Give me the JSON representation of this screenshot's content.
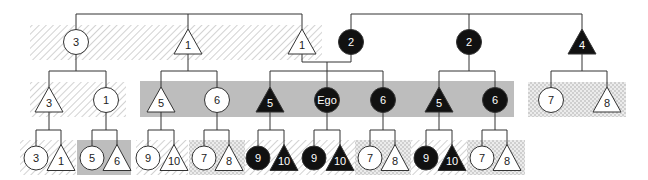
{
  "diagram": {
    "type": "kinship-chart",
    "colors": {
      "line": "#333333",
      "filled": "#111111",
      "open": "#ffffff",
      "band_gray": "#bdbdbd",
      "hatch": "#d6d6d6",
      "check": "#d4d4d4"
    },
    "regions": [
      {
        "id": "r1-hatch",
        "style": "hatch",
        "x": 30,
        "y": 25,
        "w": 292,
        "h": 35
      },
      {
        "id": "r2-hatch",
        "style": "hatch",
        "x": 30,
        "y": 82,
        "w": 96,
        "h": 35
      },
      {
        "id": "r2-gray",
        "style": "gray",
        "x": 140,
        "y": 81,
        "w": 374,
        "h": 36
      },
      {
        "id": "r2-check",
        "style": "check",
        "x": 528,
        "y": 82,
        "w": 98,
        "h": 35
      },
      {
        "id": "r3-hatch-a",
        "style": "hatch",
        "x": 20,
        "y": 140,
        "w": 56,
        "h": 35
      },
      {
        "id": "r3-gray-a",
        "style": "gray",
        "x": 77,
        "y": 140,
        "w": 54,
        "h": 35
      },
      {
        "id": "r3-hatch-b",
        "style": "hatch",
        "x": 136,
        "y": 140,
        "w": 52,
        "h": 35
      },
      {
        "id": "r3-check-a",
        "style": "check",
        "x": 189,
        "y": 140,
        "w": 56,
        "h": 35
      },
      {
        "id": "r3-hatch-c",
        "style": "hatch",
        "x": 245,
        "y": 140,
        "w": 110,
        "h": 35
      },
      {
        "id": "r3-check-b",
        "style": "check",
        "x": 355,
        "y": 140,
        "w": 56,
        "h": 35
      },
      {
        "id": "r3-hatch-d",
        "style": "hatch",
        "x": 411,
        "y": 140,
        "w": 56,
        "h": 35
      },
      {
        "id": "r3-check-c",
        "style": "check",
        "x": 467,
        "y": 140,
        "w": 58,
        "h": 35
      }
    ],
    "nodes": [
      {
        "id": "g1-a",
        "shape": "circle",
        "fill": "open",
        "label": "3",
        "x": 76,
        "y": 42
      },
      {
        "id": "g1-b",
        "shape": "triangle",
        "fill": "open",
        "label": "1",
        "x": 188,
        "y": 42
      },
      {
        "id": "g1-c",
        "shape": "triangle",
        "fill": "open",
        "label": "1",
        "x": 302,
        "y": 42
      },
      {
        "id": "g1-d",
        "shape": "circle",
        "fill": "filled",
        "label": "2",
        "x": 351,
        "y": 42
      },
      {
        "id": "g1-e",
        "shape": "circle",
        "fill": "filled",
        "label": "2",
        "x": 469,
        "y": 42
      },
      {
        "id": "g1-f",
        "shape": "triangle",
        "fill": "filled",
        "label": "4",
        "x": 582,
        "y": 42
      },
      {
        "id": "g2-a",
        "shape": "triangle",
        "fill": "open",
        "label": "3",
        "x": 49,
        "y": 100
      },
      {
        "id": "g2-b",
        "shape": "circle",
        "fill": "open",
        "label": "1",
        "x": 106,
        "y": 100
      },
      {
        "id": "g2-c",
        "shape": "triangle",
        "fill": "open",
        "label": "5",
        "x": 161,
        "y": 100
      },
      {
        "id": "g2-d",
        "shape": "circle",
        "fill": "open",
        "label": "6",
        "x": 217,
        "y": 100
      },
      {
        "id": "g2-e",
        "shape": "triangle",
        "fill": "filled",
        "label": "5",
        "x": 270,
        "y": 100
      },
      {
        "id": "g2-ego",
        "shape": "circle",
        "fill": "filled",
        "label": "Ego",
        "x": 327,
        "y": 100
      },
      {
        "id": "g2-f",
        "shape": "circle",
        "fill": "filled",
        "label": "6",
        "x": 383,
        "y": 100
      },
      {
        "id": "g2-g",
        "shape": "triangle",
        "fill": "filled",
        "label": "5",
        "x": 439,
        "y": 100
      },
      {
        "id": "g2-h",
        "shape": "circle",
        "fill": "filled",
        "label": "6",
        "x": 495,
        "y": 100
      },
      {
        "id": "g2-i",
        "shape": "circle",
        "fill": "open",
        "label": "7",
        "x": 551,
        "y": 100
      },
      {
        "id": "g2-j",
        "shape": "triangle",
        "fill": "open",
        "label": "8",
        "x": 607,
        "y": 100
      },
      {
        "id": "g3-1",
        "shape": "circle",
        "fill": "open",
        "label": "3",
        "x": 36,
        "y": 158
      },
      {
        "id": "g3-2",
        "shape": "triangle",
        "fill": "open",
        "label": "1",
        "x": 61,
        "y": 158
      },
      {
        "id": "g3-3",
        "shape": "circle",
        "fill": "open",
        "label": "5",
        "x": 92,
        "y": 158
      },
      {
        "id": "g3-4",
        "shape": "triangle",
        "fill": "open",
        "label": "6",
        "x": 117,
        "y": 158
      },
      {
        "id": "g3-5",
        "shape": "circle",
        "fill": "open",
        "label": "9",
        "x": 148,
        "y": 158
      },
      {
        "id": "g3-6",
        "shape": "triangle",
        "fill": "open",
        "label": "10",
        "x": 174,
        "y": 158
      },
      {
        "id": "g3-7",
        "shape": "circle",
        "fill": "open",
        "label": "7",
        "x": 204,
        "y": 158
      },
      {
        "id": "g3-8",
        "shape": "triangle",
        "fill": "open",
        "label": "8",
        "x": 229,
        "y": 158
      },
      {
        "id": "g3-9",
        "shape": "circle",
        "fill": "filled",
        "label": "9",
        "x": 258,
        "y": 158
      },
      {
        "id": "g3-10",
        "shape": "triangle",
        "fill": "filled",
        "label": "10",
        "x": 284,
        "y": 158
      },
      {
        "id": "g3-11",
        "shape": "circle",
        "fill": "filled",
        "label": "9",
        "x": 314,
        "y": 158
      },
      {
        "id": "g3-12",
        "shape": "triangle",
        "fill": "filled",
        "label": "10",
        "x": 340,
        "y": 158
      },
      {
        "id": "g3-13",
        "shape": "circle",
        "fill": "open",
        "label": "7",
        "x": 370,
        "y": 158
      },
      {
        "id": "g3-14",
        "shape": "triangle",
        "fill": "open",
        "label": "8",
        "x": 395,
        "y": 158
      },
      {
        "id": "g3-15",
        "shape": "circle",
        "fill": "filled",
        "label": "9",
        "x": 426,
        "y": 158
      },
      {
        "id": "g3-16",
        "shape": "triangle",
        "fill": "filled",
        "label": "10",
        "x": 452,
        "y": 158
      },
      {
        "id": "g3-17",
        "shape": "circle",
        "fill": "open",
        "label": "7",
        "x": 482,
        "y": 158
      },
      {
        "id": "g3-18",
        "shape": "triangle",
        "fill": "open",
        "label": "8",
        "x": 507,
        "y": 158
      }
    ],
    "lines": [
      [
        76,
        14,
        302,
        14
      ],
      [
        76,
        14,
        76,
        30
      ],
      [
        188,
        14,
        188,
        29
      ],
      [
        302,
        14,
        302,
        29
      ],
      [
        351,
        14,
        582,
        14
      ],
      [
        351,
        14,
        351,
        30
      ],
      [
        469,
        14,
        469,
        30
      ],
      [
        582,
        14,
        582,
        29
      ],
      [
        76,
        54,
        76,
        71
      ],
      [
        49,
        71,
        106,
        71
      ],
      [
        49,
        71,
        49,
        87
      ],
      [
        106,
        71,
        106,
        88
      ],
      [
        302,
        54,
        302,
        62
      ],
      [
        302,
        62,
        351,
        62
      ],
      [
        351,
        54,
        351,
        62
      ],
      [
        327,
        62,
        327,
        71
      ],
      [
        270,
        71,
        383,
        71
      ],
      [
        270,
        71,
        270,
        87
      ],
      [
        327,
        71,
        327,
        88
      ],
      [
        383,
        71,
        383,
        88
      ],
      [
        188,
        54,
        188,
        71
      ],
      [
        161,
        71,
        217,
        71
      ],
      [
        161,
        71,
        161,
        87
      ],
      [
        217,
        71,
        217,
        88
      ],
      [
        469,
        54,
        469,
        71
      ],
      [
        439,
        71,
        495,
        71
      ],
      [
        439,
        71,
        439,
        87
      ],
      [
        495,
        71,
        495,
        88
      ],
      [
        582,
        54,
        582,
        71
      ],
      [
        551,
        71,
        607,
        71
      ],
      [
        551,
        71,
        551,
        88
      ],
      [
        607,
        71,
        607,
        87
      ],
      [
        49,
        112,
        49,
        130
      ],
      [
        36,
        130,
        61,
        130
      ],
      [
        36,
        130,
        36,
        146
      ],
      [
        61,
        130,
        61,
        145
      ],
      [
        106,
        112,
        106,
        130
      ],
      [
        92,
        130,
        117,
        130
      ],
      [
        92,
        130,
        92,
        146
      ],
      [
        117,
        130,
        117,
        145
      ],
      [
        161,
        112,
        161,
        130
      ],
      [
        148,
        130,
        174,
        130
      ],
      [
        148,
        130,
        148,
        146
      ],
      [
        174,
        130,
        174,
        145
      ],
      [
        217,
        112,
        217,
        130
      ],
      [
        204,
        130,
        229,
        130
      ],
      [
        204,
        130,
        204,
        146
      ],
      [
        229,
        130,
        229,
        145
      ],
      [
        270,
        112,
        270,
        130
      ],
      [
        258,
        130,
        284,
        130
      ],
      [
        258,
        130,
        258,
        146
      ],
      [
        284,
        130,
        284,
        145
      ],
      [
        327,
        112,
        327,
        130
      ],
      [
        314,
        130,
        340,
        130
      ],
      [
        314,
        130,
        314,
        146
      ],
      [
        340,
        130,
        340,
        145
      ],
      [
        383,
        112,
        383,
        130
      ],
      [
        370,
        130,
        395,
        130
      ],
      [
        370,
        130,
        370,
        146
      ],
      [
        395,
        130,
        395,
        145
      ],
      [
        439,
        112,
        439,
        130
      ],
      [
        426,
        130,
        452,
        130
      ],
      [
        426,
        130,
        426,
        146
      ],
      [
        452,
        130,
        452,
        145
      ],
      [
        495,
        112,
        495,
        130
      ],
      [
        482,
        130,
        507,
        130
      ],
      [
        482,
        130,
        482,
        146
      ],
      [
        507,
        130,
        507,
        145
      ]
    ]
  }
}
